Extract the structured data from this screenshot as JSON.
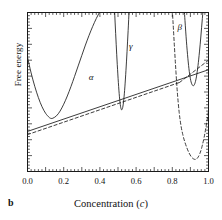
{
  "panel": {
    "letter": "b"
  },
  "axes": {
    "xlabel_text": "Concentration (",
    "xlabel_italic": "c",
    "xlabel_close": ")",
    "ylabel": "Free energy",
    "x_ticklabels": [
      "0.0",
      "0.2",
      "0.4",
      "0.6",
      "0.8",
      "1.0"
    ],
    "y_ticklabels": []
  },
  "annotations": [
    {
      "name": "alpha",
      "text": "α",
      "x": 0.355,
      "y": 0.585
    },
    {
      "name": "gamma",
      "text": "γ",
      "x": 0.578,
      "y": 0.785
    },
    {
      "name": "beta",
      "text": "β",
      "x": 0.845,
      "y": 0.905
    }
  ],
  "colors": {
    "ink": "#1a1a1a",
    "frame": "#1a1a1a",
    "background": "#ffffff"
  },
  "chart_data": {
    "type": "line",
    "title": "",
    "xlabel": "Concentration (c)",
    "ylabel": "Free energy",
    "xlim": [
      0.0,
      1.0
    ],
    "ylim": [
      0.0,
      1.0
    ],
    "grid": false,
    "legend": "none",
    "x_major_tick_step": 0.1,
    "x_minor_tick_step": 0.02,
    "x_label_step": 0.2,
    "y_major_tick_step": 0.1,
    "y_minor_tick_step": 0.02,
    "tick_direction": "in",
    "series": [
      {
        "name": "alpha-free-energy-curve",
        "label": "α",
        "style": "solid",
        "comment": "broad parabola, minimum near c=0.13, rises off top of frame near c=0.47",
        "points": [
          [
            0.0,
            0.718
          ],
          [
            0.02,
            0.62
          ],
          [
            0.04,
            0.536
          ],
          [
            0.06,
            0.465
          ],
          [
            0.08,
            0.408
          ],
          [
            0.1,
            0.366
          ],
          [
            0.12,
            0.34
          ],
          [
            0.13,
            0.334
          ],
          [
            0.14,
            0.335
          ],
          [
            0.16,
            0.35
          ],
          [
            0.18,
            0.38
          ],
          [
            0.2,
            0.423
          ],
          [
            0.22,
            0.475
          ],
          [
            0.24,
            0.534
          ],
          [
            0.26,
            0.598
          ],
          [
            0.28,
            0.664
          ],
          [
            0.3,
            0.73
          ],
          [
            0.32,
            0.795
          ],
          [
            0.34,
            0.856
          ],
          [
            0.36,
            0.912
          ],
          [
            0.38,
            0.962
          ],
          [
            0.4,
            1.005
          ],
          [
            0.42,
            1.042
          ],
          [
            0.44,
            1.072
          ],
          [
            0.455,
            1.09
          ]
        ]
      },
      {
        "name": "gamma-free-energy-curve",
        "label": "γ",
        "style": "solid",
        "comment": "narrow steep parabola, minimum at c=0.52 tangent to common-tangent line",
        "points": [
          [
            0.478,
            1.09
          ],
          [
            0.484,
            0.94
          ],
          [
            0.49,
            0.8
          ],
          [
            0.496,
            0.672
          ],
          [
            0.502,
            0.56
          ],
          [
            0.508,
            0.47
          ],
          [
            0.514,
            0.41
          ],
          [
            0.52,
            0.388
          ],
          [
            0.526,
            0.403
          ],
          [
            0.532,
            0.452
          ],
          [
            0.538,
            0.532
          ],
          [
            0.544,
            0.636
          ],
          [
            0.55,
            0.756
          ],
          [
            0.556,
            0.886
          ],
          [
            0.562,
            1.02
          ],
          [
            0.568,
            1.09
          ]
        ]
      },
      {
        "name": "beta-free-energy-curve-solid",
        "label": "β",
        "style": "solid",
        "comment": "right-hand well, minimum near c=0.92",
        "points": [
          [
            0.862,
            1.09
          ],
          [
            0.87,
            0.95
          ],
          [
            0.878,
            0.82
          ],
          [
            0.886,
            0.712
          ],
          [
            0.894,
            0.628
          ],
          [
            0.902,
            0.572
          ],
          [
            0.91,
            0.545
          ],
          [
            0.918,
            0.54
          ],
          [
            0.926,
            0.558
          ],
          [
            0.934,
            0.6
          ],
          [
            0.942,
            0.666
          ],
          [
            0.95,
            0.752
          ],
          [
            0.958,
            0.852
          ],
          [
            0.966,
            0.962
          ],
          [
            0.974,
            1.06
          ],
          [
            0.98,
            1.09
          ]
        ]
      },
      {
        "name": "beta-free-energy-curve-dashed",
        "label": "β",
        "style": "dashed",
        "comment": "shifted dashed well, descends steeply from top near c=0.80 to minimum c=0.93",
        "points": [
          [
            0.796,
            1.09
          ],
          [
            0.804,
            0.94
          ],
          [
            0.812,
            0.78
          ],
          [
            0.82,
            0.63
          ],
          [
            0.828,
            0.496
          ],
          [
            0.838,
            0.372
          ],
          [
            0.848,
            0.288
          ],
          [
            0.858,
            0.232
          ],
          [
            0.868,
            0.19
          ],
          [
            0.88,
            0.15
          ],
          [
            0.892,
            0.118
          ],
          [
            0.904,
            0.094
          ],
          [
            0.916,
            0.08
          ],
          [
            0.928,
            0.076
          ],
          [
            0.94,
            0.086
          ],
          [
            0.952,
            0.112
          ],
          [
            0.964,
            0.156
          ],
          [
            0.976,
            0.216
          ],
          [
            0.988,
            0.292
          ],
          [
            1.0,
            0.38
          ]
        ]
      },
      {
        "name": "common-tangent-line-solid",
        "style": "solid",
        "comment": "common tangent touching alpha minimum and gamma minimum, extended to frame",
        "points": [
          [
            0.0,
            0.252
          ],
          [
            1.0,
            0.64
          ]
        ]
      },
      {
        "name": "common-tangent-line-dashed",
        "style": "dashed",
        "comment": "alternate common tangent from alpha well to dashed beta branch at c=0.84",
        "points": [
          [
            0.0,
            0.232
          ],
          [
            0.84,
            0.56
          ]
        ]
      },
      {
        "name": "tangent-continuation-dashed",
        "style": "dashed",
        "comment": "dashed continuation rising to upper right toward solid beta well",
        "points": [
          [
            0.84,
            0.56
          ],
          [
            1.0,
            0.7
          ]
        ]
      }
    ]
  }
}
